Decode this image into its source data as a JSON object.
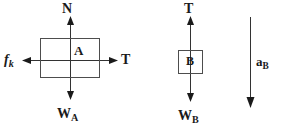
{
  "figure": {
    "background_color": "#ffffff",
    "stroke_color": "#333333",
    "box_stroke_color": "#4d4d4d",
    "text_color": "#1a1a1a"
  },
  "block_a": {
    "box_label": "A",
    "forces": {
      "normal": {
        "symbol": "N",
        "subscript": "",
        "direction": "up"
      },
      "weight": {
        "symbol": "W",
        "subscript": "A",
        "direction": "down"
      },
      "friction": {
        "symbol": "f",
        "subscript": "k",
        "direction": "left"
      },
      "tension": {
        "symbol": "T",
        "subscript": "",
        "direction": "right"
      }
    }
  },
  "block_b": {
    "box_label": "B",
    "forces": {
      "tension": {
        "symbol": "T",
        "subscript": "",
        "direction": "up"
      },
      "weight": {
        "symbol": "W",
        "subscript": "B",
        "direction": "down"
      }
    }
  },
  "acceleration": {
    "symbol": "a",
    "subscript": "B",
    "direction": "down"
  }
}
